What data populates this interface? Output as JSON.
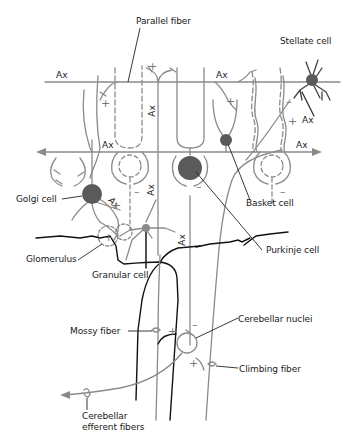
{
  "diagram": {
    "labels": {
      "parallel_fiber": "Parallel fiber",
      "stellate_cell": "Stellate cell",
      "golgi_cell": "Golgi cell",
      "basket_cell": "Basket cell",
      "glomerulus": "Glomerulus",
      "granular_cell": "Granular cell",
      "purkinje_cell": "Purkinje cell",
      "mossy_fiber": "Mossy fiber",
      "cerebellar_nuclei": "Cerebellar nuclei",
      "climbing_fiber": "Climbing fiber",
      "cerebellar_efferent_fibers_line1": "Cerebellar",
      "cerebellar_efferent_fibers_line2": "efferent fibers"
    },
    "axon_label": "Ax",
    "signs": {
      "plus": "+",
      "minus": "–"
    },
    "colors": {
      "fiber": "#8a8a8a",
      "soma": "#5a5a5a",
      "text": "#1a1a1a",
      "white_matter_border": "#111111",
      "background": "#ffffff"
    }
  }
}
